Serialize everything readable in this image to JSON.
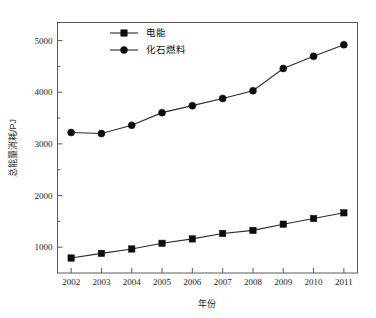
{
  "chart_data": {
    "type": "line",
    "title": "",
    "xlabel": "年份",
    "ylabel": "总能量消耗/PJ",
    "x": [
      2002,
      2003,
      2004,
      2005,
      2006,
      2007,
      2008,
      2009,
      2010,
      2011
    ],
    "categories": [
      "2002",
      "2003",
      "2004",
      "2005",
      "2006",
      "2007",
      "2008",
      "2009",
      "2010",
      "2011"
    ],
    "series": [
      {
        "name": "电能",
        "marker": "square",
        "color": "#0d0d0d",
        "values": [
          790,
          880,
          965,
          1075,
          1160,
          1265,
          1325,
          1445,
          1555,
          1665
        ]
      },
      {
        "name": "化石燃料",
        "marker": "circle",
        "color": "#0d0d0d",
        "values": [
          3220,
          3200,
          3360,
          3605,
          3740,
          3880,
          4030,
          4460,
          4695,
          4920
        ]
      }
    ],
    "xlim": [
      2001.55,
      2011.45
    ],
    "ylim": [
      500,
      5350
    ],
    "ytick_labels": [
      "1000",
      "2000",
      "3000",
      "4000",
      "5000"
    ],
    "ytick_values": [
      1000,
      2000,
      3000,
      4000,
      5000
    ],
    "yminor_values": [
      1500,
      2500,
      3500,
      4500
    ],
    "grid": false,
    "legend_position": "top-left-inside"
  },
  "axes": {
    "x_title": "年份",
    "y_title": "总能量消耗/PJ",
    "x_tick_labels": [
      "2002",
      "2003",
      "2004",
      "2005",
      "2006",
      "2007",
      "2008",
      "2009",
      "2010",
      "2011"
    ],
    "y_tick_labels": [
      "1000",
      "2000",
      "3000",
      "4000",
      "5000"
    ]
  },
  "legend": {
    "entries": [
      {
        "label": "电能",
        "marker": "square-marker-icon"
      },
      {
        "label": "化石燃料",
        "marker": "circle-marker-icon"
      }
    ]
  },
  "colors": {
    "line": "#2b2b2b",
    "marker": "#0d0d0d",
    "frame": "#5a5a5a",
    "background": "#ffffff",
    "text": "#1c1c1c"
  }
}
